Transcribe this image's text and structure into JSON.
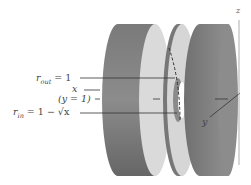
{
  "diagram": {
    "type": "washer-method-3d",
    "labels": {
      "r_out_main": "r",
      "r_out_sub": "out",
      "r_out_rest": " = 1",
      "x": "x",
      "y_eq": "(y = 1)",
      "r_in_main": "r",
      "r_in_sub": "in",
      "r_in_rest": " = 1 − √x",
      "y_axis": "y",
      "z_axis": "z"
    },
    "colors": {
      "disk_side_dark": "#6e6e6e",
      "disk_side_mid": "#8a8a8a",
      "disk_face": "#d9d9d9",
      "line": "#333333",
      "axis": "#999999"
    }
  }
}
